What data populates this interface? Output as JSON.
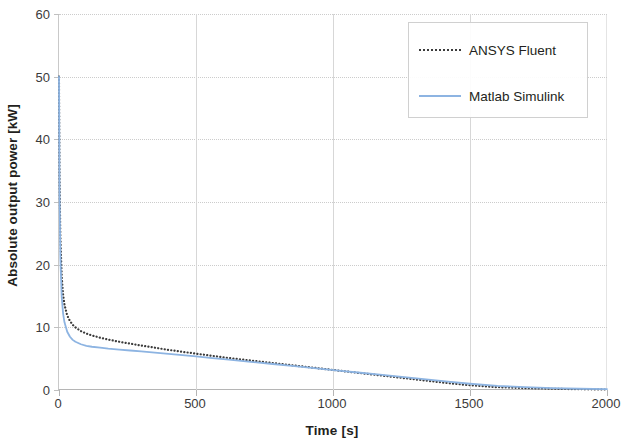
{
  "chart_data": {
    "type": "line",
    "title": "",
    "xlabel": "Time [s]",
    "ylabel": "Absolute output power [kW]",
    "xlim": [
      0,
      2000
    ],
    "ylim": [
      0,
      60
    ],
    "xticks": [
      0,
      500,
      1000,
      1500,
      2000
    ],
    "yticks": [
      0,
      10,
      20,
      30,
      40,
      50,
      60
    ],
    "grid": true,
    "legend_position": "top-right",
    "series": [
      {
        "name": "ANSYS Fluent",
        "style": "dotted",
        "color": "#3b3b3b",
        "x": [
          0,
          2,
          5,
          10,
          15,
          20,
          30,
          40,
          50,
          60,
          80,
          100,
          120,
          150,
          180,
          220,
          260,
          300,
          350,
          400,
          450,
          500,
          560,
          620,
          700,
          780,
          860,
          940,
          1020,
          1100,
          1180,
          1260,
          1340,
          1420,
          1500,
          1600,
          1700,
          1800,
          1900,
          2000
        ],
        "y": [
          50.0,
          34.0,
          24.5,
          18.0,
          15.2,
          13.6,
          11.9,
          11.0,
          10.4,
          10.0,
          9.4,
          9.0,
          8.7,
          8.35,
          8.05,
          7.7,
          7.4,
          7.1,
          6.75,
          6.4,
          6.1,
          5.8,
          5.45,
          5.1,
          4.7,
          4.3,
          3.9,
          3.5,
          3.1,
          2.7,
          2.3,
          1.9,
          1.5,
          1.1,
          0.75,
          0.45,
          0.3,
          0.2,
          0.12,
          0.08
        ]
      },
      {
        "name": "Matlab Simulink",
        "style": "solid",
        "color": "#8db4e2",
        "x": [
          0,
          2,
          5,
          10,
          15,
          20,
          30,
          40,
          50,
          60,
          80,
          100,
          120,
          150,
          180,
          220,
          260,
          300,
          350,
          400,
          450,
          500,
          560,
          620,
          700,
          780,
          860,
          940,
          1020,
          1100,
          1180,
          1260,
          1340,
          1420,
          1500,
          1600,
          1700,
          1800,
          1900,
          2000
        ],
        "y": [
          50.0,
          31.0,
          21.0,
          14.8,
          12.2,
          10.8,
          9.3,
          8.5,
          8.0,
          7.7,
          7.3,
          7.05,
          6.9,
          6.75,
          6.6,
          6.45,
          6.3,
          6.15,
          5.95,
          5.75,
          5.55,
          5.35,
          5.1,
          4.85,
          4.5,
          4.15,
          3.8,
          3.45,
          3.1,
          2.75,
          2.4,
          2.05,
          1.7,
          1.35,
          1.0,
          0.65,
          0.45,
          0.3,
          0.2,
          0.15
        ]
      }
    ]
  }
}
